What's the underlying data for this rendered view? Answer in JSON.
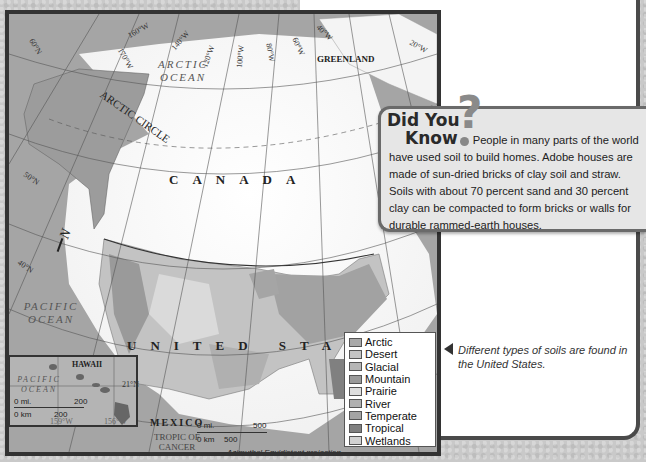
{
  "map": {
    "labels": {
      "arctic_ocean": "ARCTIC OCEAN",
      "arctic_circle": "ARCTIC CIRCLE",
      "greenland": "GREENLAND",
      "canada": "CANADA",
      "united_states": "UNITED STATES",
      "pacific_ocean": "PACIFIC OCEAN",
      "mexico": "MEXICO",
      "tropic_of_cancer": "TROPIC OF CANCER",
      "projection": "Azimuthal Equidistant projection",
      "north_arrow": "N"
    },
    "graticule": {
      "latitudes": [
        "60°N",
        "50°N",
        "40°N",
        "30°N"
      ],
      "longitudes": [
        "160°W",
        "170°W",
        "140°W",
        "120°W",
        "100°W",
        "80°W",
        "60°W",
        "40°W",
        "20°W"
      ]
    },
    "scale": {
      "mi_label": "0 mi.",
      "mi_value": "500",
      "km_label": "0 km",
      "km_value": "500"
    },
    "hawaii_inset": {
      "title": "HAWAII",
      "ocean": "PACIFIC OCEAN",
      "lat": "21°N",
      "lon_left": "159°W",
      "lon_right": "156°W",
      "scale_mi_label": "0 mi.",
      "scale_mi_value": "200",
      "scale_km_label": "0 km",
      "scale_km_value": "200"
    },
    "legend": [
      {
        "label": "Arctic",
        "color": "#a9a9a9"
      },
      {
        "label": "Desert",
        "color": "#c4c4c4"
      },
      {
        "label": "Glacial",
        "color": "#b6b6b6"
      },
      {
        "label": "Mountain",
        "color": "#9a9a9a"
      },
      {
        "label": "Prairie",
        "color": "#dedede"
      },
      {
        "label": "River",
        "color": "#b0b0b0"
      },
      {
        "label": "Temperate",
        "color": "#a4a4a4"
      },
      {
        "label": "Tropical",
        "color": "#808080"
      },
      {
        "label": "Wetlands",
        "color": "#d2d2d2"
      }
    ]
  },
  "did_you_know": {
    "title_line1": "Did You",
    "title_line2": "Know",
    "text_line1": "People in many parts of the",
    "text_rest": "world have used soil to build homes. Adobe houses are made of sun-dried bricks of clay soil and straw. Soils with about 70 percent sand and 30 percent clay can be compacted to form bricks or walls for durable rammed-earth houses."
  },
  "caption": "Different types of soils are found in the United States."
}
